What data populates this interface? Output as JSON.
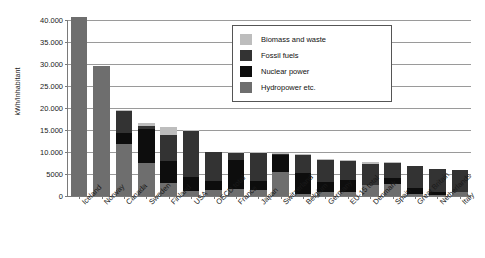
{
  "chart_data": {
    "type": "bar",
    "title": "",
    "subtitle": "",
    "xlabel": "",
    "ylabel": "kWh/Inhabitant",
    "ylim": [
      0,
      40000
    ],
    "yticks": [
      0,
      5000,
      10000,
      15000,
      20000,
      25000,
      30000,
      35000,
      40000
    ],
    "ytick_labels": [
      "0",
      "5000",
      "10.000",
      "15.000",
      "20.000",
      "25.000",
      "30.000",
      "35.000",
      "40.000"
    ],
    "grid": true,
    "stacked": true,
    "legend_position": "top-right",
    "categories": [
      "Iceland",
      "Norway",
      "Canada",
      "Sweden",
      "Finland",
      "USA",
      "OECD total",
      "France",
      "Japan",
      "Switzerland",
      "Belgium",
      "Germany",
      "EU-15 total",
      "Denmark",
      "Spain",
      "Great Britain",
      "Netherlands",
      "Italy"
    ],
    "series": [
      {
        "name": "Hydropower etc.",
        "color": "#6e6e6e",
        "values": [
          40600,
          29600,
          11800,
          7500,
          3000,
          1100,
          1300,
          1700,
          1300,
          5500,
          500,
          800,
          900,
          2400,
          2800,
          400,
          300,
          1000
        ]
      },
      {
        "name": "Nuclear power",
        "color": "#0d0d0d",
        "values": [
          0,
          0,
          2600,
          7700,
          5000,
          3200,
          2100,
          6600,
          2000,
          3900,
          4800,
          2300,
          2700,
          0,
          1300,
          1500,
          600,
          0
        ]
      },
      {
        "name": "Fossil fuels",
        "color": "#333333",
        "values": [
          0,
          0,
          5000,
          800,
          5900,
          10500,
          6500,
          1500,
          6500,
          200,
          4000,
          5100,
          4400,
          4900,
          3500,
          4900,
          5200,
          4900
        ]
      },
      {
        "name": "Biomass and waste",
        "color": "#bdbdbd",
        "values": [
          0,
          0,
          200,
          700,
          1700,
          100,
          200,
          200,
          200,
          100,
          200,
          200,
          200,
          500,
          200,
          100,
          100,
          100
        ]
      }
    ],
    "totals": [
      40600,
      29600,
      19600,
      16700,
      15600,
      14900,
      10100,
      10000,
      10000,
      9700,
      9500,
      8400,
      8200,
      7800,
      7800,
      6900,
      6200,
      6000
    ]
  },
  "legend": {
    "items": [
      {
        "label": "Biomass and waste",
        "color": "#bdbdbd"
      },
      {
        "label": "Fossil fuels",
        "color": "#333333"
      },
      {
        "label": "Nuclear power",
        "color": "#0d0d0d"
      },
      {
        "label": "Hydropower etc.",
        "color": "#6e6e6e"
      }
    ]
  }
}
